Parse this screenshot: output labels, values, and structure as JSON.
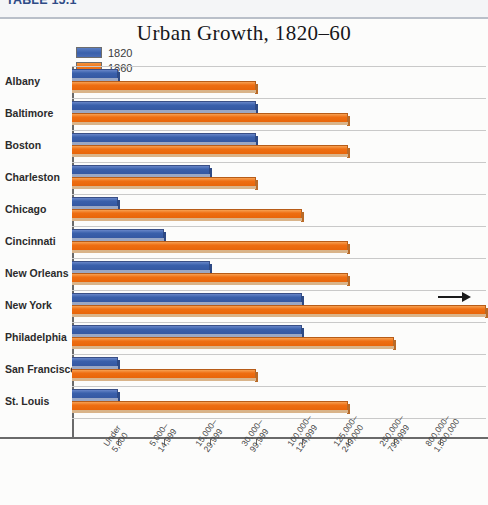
{
  "table": {
    "label": "TABLE 15.1"
  },
  "legend": {
    "position": "top-left",
    "items": [
      {
        "label": "1820",
        "color": "#3a60ab"
      },
      {
        "label": "1860",
        "color": "#ee6e12"
      }
    ]
  },
  "chart_data": {
    "type": "bar",
    "orientation": "horizontal",
    "title": "Urban Growth, 1820–60",
    "xlabel": "",
    "ylabel": "",
    "grid": true,
    "legend_position": "top-left",
    "categories": [
      "Albany",
      "Baltimore",
      "Boston",
      "Charleston",
      "Chicago",
      "Cincinnati",
      "New Orleans",
      "New York",
      "Philadelphia",
      "San Francisco",
      "St. Louis"
    ],
    "x_tick_labels": [
      "Under 5,000",
      "5,000–14,999",
      "15,000–29,999",
      "30,000–99,999",
      "100,000–124,999",
      "125,000–249,000",
      "250,000–799,999",
      "800,000–1,500,000"
    ],
    "x_tick_labels_lines": [
      [
        "Under",
        "5,000"
      ],
      [
        "5,000–",
        "14,999"
      ],
      [
        "15,000–",
        "29,999"
      ],
      [
        "30,000–",
        "99,999"
      ],
      [
        "100,000–",
        "124,999"
      ],
      [
        "125,000–",
        "249,000"
      ],
      [
        "250,000–",
        "799,999"
      ],
      [
        "800,000–",
        "1,500,000"
      ]
    ],
    "x_bin_count": 8,
    "series": [
      {
        "name": "1820",
        "color": "#3a60ab",
        "values": [
          1,
          4,
          4,
          3,
          1,
          2,
          3,
          5,
          5,
          1,
          1
        ]
      },
      {
        "name": "1860",
        "color": "#ee6e12",
        "values": [
          4,
          6,
          6,
          4,
          5,
          6,
          6,
          9,
          7,
          4,
          6
        ]
      }
    ],
    "value_units": "population bin index (1 = 'Under 5,000' ... 8 = '800,000–1,500,000')",
    "annotations": [
      {
        "series": "1860",
        "category": "New York",
        "type": "overflow-arrow",
        "text": "→",
        "note": "bar extends past plot area"
      }
    ]
  }
}
